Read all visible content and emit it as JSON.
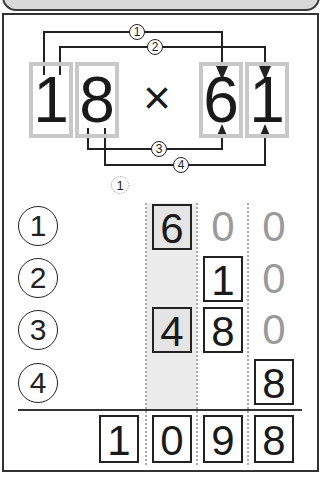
{
  "problem": {
    "left_digits": [
      "1",
      "8"
    ],
    "operator": "×",
    "right_digits": [
      "6",
      "1"
    ],
    "arrow_labels": [
      "1",
      "2",
      "3",
      "4"
    ]
  },
  "carry_mark": "1",
  "rows": [
    {
      "label": "1",
      "cells": [
        null,
        {
          "v": "6",
          "style": "shadedbox"
        },
        {
          "v": "0",
          "style": "gray"
        },
        {
          "v": "0",
          "style": "gray"
        }
      ]
    },
    {
      "label": "2",
      "cells": [
        null,
        null,
        {
          "v": "1",
          "style": "boxed"
        },
        {
          "v": "0",
          "style": "gray"
        }
      ]
    },
    {
      "label": "3",
      "cells": [
        null,
        {
          "v": "4",
          "style": "shadedbox"
        },
        {
          "v": "8",
          "style": "boxed"
        },
        {
          "v": "0",
          "style": "gray"
        }
      ]
    },
    {
      "label": "4",
      "cells": [
        null,
        null,
        null,
        {
          "v": "8",
          "style": "boxed"
        }
      ]
    }
  ],
  "sum": [
    "1",
    "0",
    "9",
    "8"
  ],
  "colors": {
    "digit_box_outline": "#c8c8c8",
    "shaded_column": "#ececec",
    "gray_zero": "#9a9a9a",
    "ink": "#1a1a1a"
  }
}
